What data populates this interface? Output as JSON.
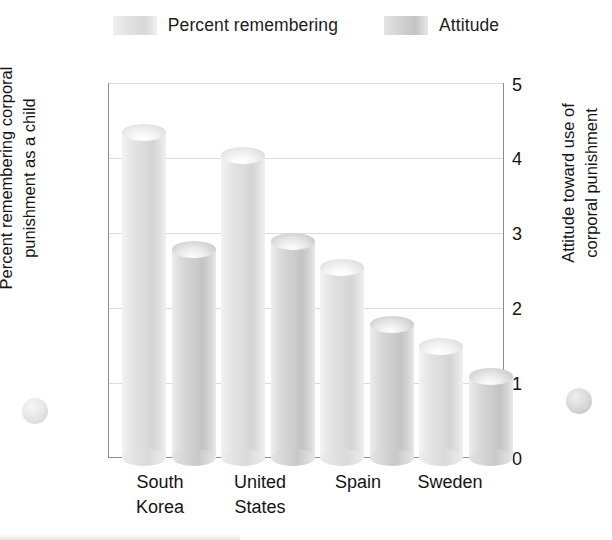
{
  "legend": {
    "entries": [
      {
        "label": "Percent remembering",
        "swatch": "percent-swatch"
      },
      {
        "label": "Attitude",
        "swatch": "attitude-swatch"
      }
    ]
  },
  "axes": {
    "left_title_line1": "Percent remembering corporal",
    "left_title_line2": "punishment as a child",
    "right_title_line1": "Attitude toward use of",
    "right_title_line2": "corporal punishment",
    "left_ticks": [
      "100",
      "80",
      "60",
      "40",
      "20",
      "0"
    ],
    "right_ticks": [
      "5",
      "4",
      "3",
      "2",
      "1",
      "0"
    ]
  },
  "categories": [
    {
      "line1": "South",
      "line2": "Korea"
    },
    {
      "line1": "United",
      "line2": "States"
    },
    {
      "line1": "Spain",
      "line2": ""
    },
    {
      "line1": "Sweden",
      "line2": ""
    }
  ],
  "chart_data": {
    "type": "bar",
    "title": "",
    "subtitle": "",
    "xlabel": "",
    "ylabel": "Percent remembering corporal punishment as a child",
    "y2label": "Attitude toward use of corporal punishment",
    "categories": [
      "South Korea",
      "United States",
      "Spain",
      "Sweden"
    ],
    "series": [
      {
        "name": "Percent remembering",
        "axis": "left",
        "values": [
          89,
          83,
          53,
          32
        ]
      },
      {
        "name": "Attitude",
        "axis": "right",
        "values": [
          2.9,
          3.0,
          1.9,
          1.2
        ]
      }
    ],
    "ylim": [
      0,
      100
    ],
    "y2lim": [
      0,
      5
    ],
    "yticks": [
      0,
      20,
      40,
      60,
      80,
      100
    ],
    "y2ticks": [
      0,
      1,
      2,
      3,
      4,
      5
    ],
    "grid": true,
    "legend_position": "top",
    "bar_style": "3d-cylinder"
  }
}
